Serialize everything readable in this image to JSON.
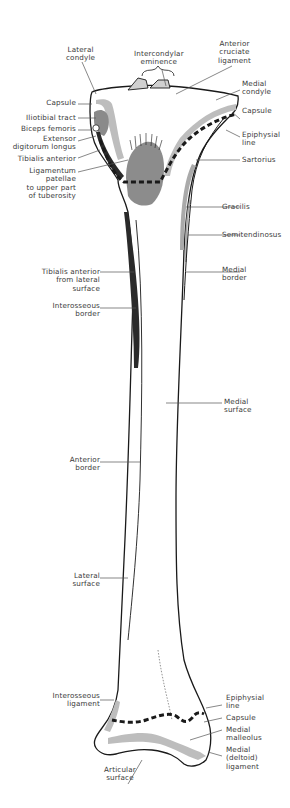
{
  "figure": {
    "colors": {
      "outline": "#1a1a1a",
      "capsule_gray": "#bdbdbd",
      "muscle_dark": "#333333",
      "ligamentum_gray": "#8c8c8c",
      "leader_line": "#555555",
      "background": "#ffffff"
    }
  },
  "labels": {
    "top": {
      "lateral_condyle": "Lateral\ncondyle",
      "intercondylar_eminence": "Intercondylar\neminence",
      "anterior_cruciate_ligament": "Anterior\ncruciate\nligament"
    },
    "left_upper": {
      "capsule": "Capsule",
      "iliotibial_tract": "Iliotibial tract",
      "biceps_femoris": "Biceps femoris",
      "extensor_digitorum_longus": "Extensor\ndigitorum longus",
      "tibialis_anterior": "Tibialis anterior",
      "ligamentum_patellae": "Ligamentum\npatellae\nto upper part\nof tuberosity"
    },
    "right_upper": {
      "medial_condyle": "Medial\ncondyle",
      "capsule": "Capsule",
      "epiphysial_line": "Epiphysial\nline",
      "sartorius": "Sartorius",
      "gracilis": "Gracilis",
      "semitendinosus": "Semitendinosus",
      "medial_border": "Medial\nborder"
    },
    "left_shaft": {
      "tibialis_anterior_lateral": "Tibialis anterior\nfrom lateral\nsurface",
      "interosseous_border": "Interosseous\nborder",
      "anterior_border": "Anterior\nborder",
      "lateral_surface": "Lateral\nsurface"
    },
    "right_shaft": {
      "medial_surface": "Medial\nsurface"
    },
    "bottom_left": {
      "interosseous_ligament": "Interosseous\nligament",
      "articular_surface": "Articular\nsurface"
    },
    "bottom_right": {
      "epiphysial_line": "Epiphysial\nline",
      "capsule": "Capsule",
      "medial_malleolus": "Medial\nmalleolus",
      "medial_deltoid_ligament": "Medial\n(deltoid)\nligament"
    }
  }
}
